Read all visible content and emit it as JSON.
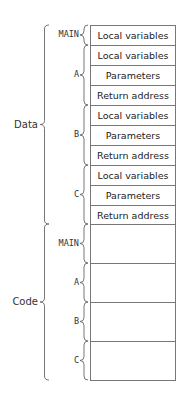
{
  "diagram": {
    "sections": [
      {
        "name": "Data",
        "top": 25,
        "bottom": 224,
        "label_y": 127
      },
      {
        "name": "Code",
        "top": 224,
        "bottom": 380,
        "label_y": 302
      }
    ],
    "data_cells": [
      {
        "text": "Local variables",
        "top": 25,
        "height": 20
      },
      {
        "text": "Local variables",
        "top": 45,
        "height": 20
      },
      {
        "text": "Parameters",
        "top": 65,
        "height": 20
      },
      {
        "text": "Return address",
        "top": 85,
        "height": 20
      },
      {
        "text": "Local variables",
        "top": 105,
        "height": 20
      },
      {
        "text": "Parameters",
        "top": 125,
        "height": 20
      },
      {
        "text": "Return address",
        "top": 145,
        "height": 20
      },
      {
        "text": "Local variables",
        "top": 165,
        "height": 20
      },
      {
        "text": "Parameters",
        "top": 185,
        "height": 20
      },
      {
        "text": "Return address",
        "top": 205,
        "height": 19
      }
    ],
    "code_cells": [
      {
        "text": "",
        "top": 224,
        "height": 39
      },
      {
        "text": "",
        "top": 263,
        "height": 39
      },
      {
        "text": "",
        "top": 302,
        "height": 39
      },
      {
        "text": "",
        "top": 341,
        "height": 39
      }
    ],
    "data_groups": [
      {
        "name": "MAIN",
        "top": 25,
        "bottom": 45
      },
      {
        "name": "A",
        "top": 45,
        "bottom": 105
      },
      {
        "name": "B",
        "top": 105,
        "bottom": 165
      },
      {
        "name": "C",
        "top": 165,
        "bottom": 224
      }
    ],
    "code_groups": [
      {
        "name": "MAIN",
        "top": 224,
        "bottom": 263
      },
      {
        "name": "A",
        "top": 263,
        "bottom": 302
      },
      {
        "name": "B",
        "top": 302,
        "bottom": 341
      },
      {
        "name": "C",
        "top": 341,
        "bottom": 380
      }
    ]
  }
}
